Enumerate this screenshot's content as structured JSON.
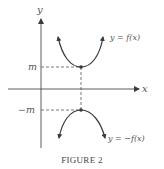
{
  "figure": {
    "caption": "FIGURE 2",
    "axes": {
      "x_label": "x",
      "y_label": "y"
    },
    "ticks": {
      "m": "m",
      "neg_m": "−m"
    },
    "curves": [
      {
        "label": "y = f(x)",
        "shape": "upward parabola",
        "min_value": "m"
      },
      {
        "label": "y = −f(x)",
        "shape": "downward parabola",
        "max_value": "−m"
      }
    ],
    "colors": {
      "curve": "#3a3a3a",
      "axis": "#4a4a4a",
      "dashed": "#555555",
      "text": "#555555"
    }
  }
}
